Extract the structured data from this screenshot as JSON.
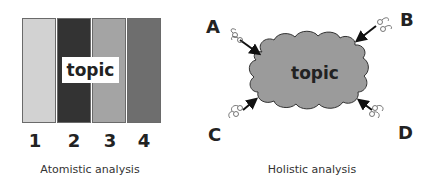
{
  "atomistic": {
    "topic_label": "topic",
    "bars": [
      {
        "number": "1",
        "color": "#d2d2d2"
      },
      {
        "number": "2",
        "color": "#333333"
      },
      {
        "number": "3",
        "color": "#a4a4a4"
      },
      {
        "number": "4",
        "color": "#6e6e6e"
      }
    ],
    "caption": "Atomistic analysis"
  },
  "holistic": {
    "topic_label": "topic",
    "cloud_color": "#9b9b9b",
    "observers": [
      {
        "label": "A",
        "icon": "glasses-icon"
      },
      {
        "label": "B",
        "icon": "glasses-icon"
      },
      {
        "label": "C",
        "icon": "glasses-icon"
      },
      {
        "label": "D",
        "icon": "glasses-icon"
      }
    ],
    "caption": "Holistic analysis"
  }
}
